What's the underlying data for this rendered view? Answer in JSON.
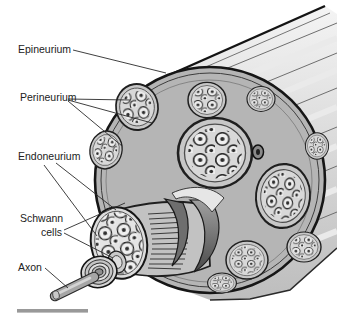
{
  "figure": {
    "type": "anatomical-diagram",
    "labels": {
      "epineurium": "Epineurium",
      "perineurium": "Perineurium",
      "endoneurium": "Endoneurium",
      "schwann_line1": "Schwann",
      "schwann_line2": "cells",
      "axon": "Axon"
    },
    "colors": {
      "background": "#ffffff",
      "outline": "#1c1c1c",
      "epineurium_face": "#b5b5b5",
      "fascicle_fill": "#d8d8d8",
      "axon_fiber": "#eeeeee",
      "trunk_light": "#f4f4f4",
      "trunk_dark": "#bdbdbd",
      "peeled_sheath_dark": "#4a4a4a",
      "scale_bar": "#999999",
      "label_text": "#222222"
    }
  }
}
